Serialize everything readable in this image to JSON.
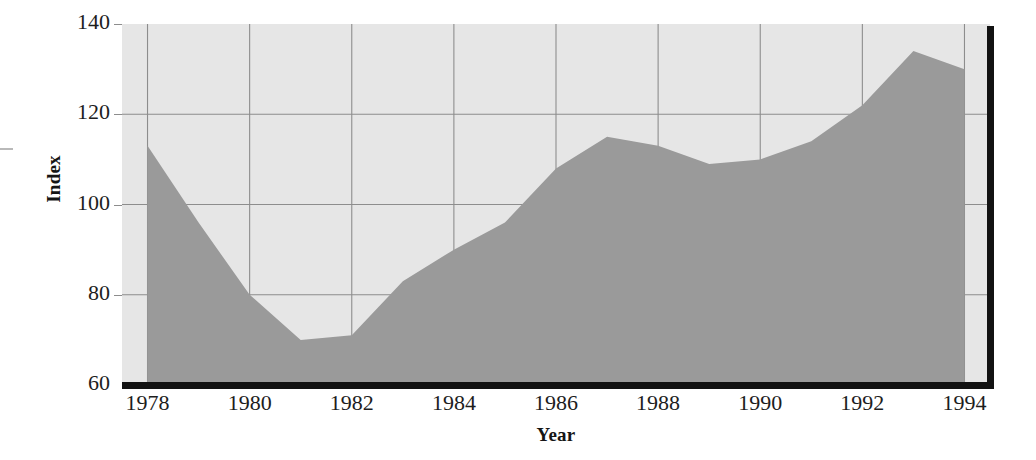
{
  "chart_data": {
    "type": "area",
    "title": "",
    "xlabel": "Year",
    "ylabel": "Index",
    "xlim": [
      1977.5,
      1994.5
    ],
    "ylim": [
      60,
      140
    ],
    "grid": true,
    "legend": "none",
    "x_ticks": [
      "1978",
      "1980",
      "1982",
      "1984",
      "1986",
      "1988",
      "1990",
      "1992",
      "1994"
    ],
    "y_ticks": [
      "60",
      "80",
      "100",
      "120",
      "140"
    ],
    "x": [
      1978,
      1979,
      1980,
      1981,
      1982,
      1983,
      1984,
      1985,
      1986,
      1987,
      1988,
      1989,
      1990,
      1991,
      1992,
      1993,
      1994
    ],
    "values": [
      113,
      96,
      80,
      70,
      71,
      83,
      90,
      96,
      108,
      115,
      113,
      109,
      110,
      114,
      122,
      134,
      130
    ],
    "series": [
      {
        "name": "Index",
        "values": [
          113,
          96,
          80,
          70,
          71,
          83,
          90,
          96,
          108,
          115,
          113,
          109,
          110,
          114,
          122,
          134,
          130
        ]
      }
    ],
    "colors": {
      "area_fill": "#9a9a9a",
      "plot_background": "#e6e6e6",
      "gridline": "#8d8d8d",
      "axis_line": "#121212",
      "text": "#1d1d1d"
    }
  },
  "axes": {
    "y_title": "Index",
    "x_title": "Year"
  }
}
